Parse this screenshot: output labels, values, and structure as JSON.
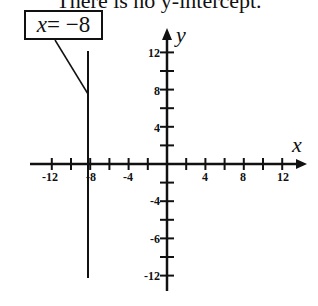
{
  "caption": "There is no y-intercept.",
  "label_box": {
    "var": "x",
    "eq": " = −8"
  },
  "chart_data": {
    "type": "line",
    "title": "There is no y-intercept.",
    "xlabel": "x",
    "ylabel": "y",
    "xlim": [
      -13,
      13
    ],
    "ylim": [
      -13,
      13
    ],
    "x_tick_labels": [
      "-12",
      "-8",
      "-4",
      "4",
      "8",
      "12"
    ],
    "y_tick_labels": [
      "12",
      "8",
      "4",
      "-4",
      "-6",
      "-12"
    ],
    "minor_tick_step": 2,
    "grid": false,
    "series": [
      {
        "name": "x = -8",
        "type": "vertical-line",
        "x": -8,
        "y_range": [
          -12,
          12
        ]
      }
    ],
    "annotations": [
      {
        "text": "x = −8",
        "points_to": [
          -8,
          8
        ]
      }
    ]
  },
  "colors": {
    "ink": "#111111",
    "background": "#ffffff"
  }
}
